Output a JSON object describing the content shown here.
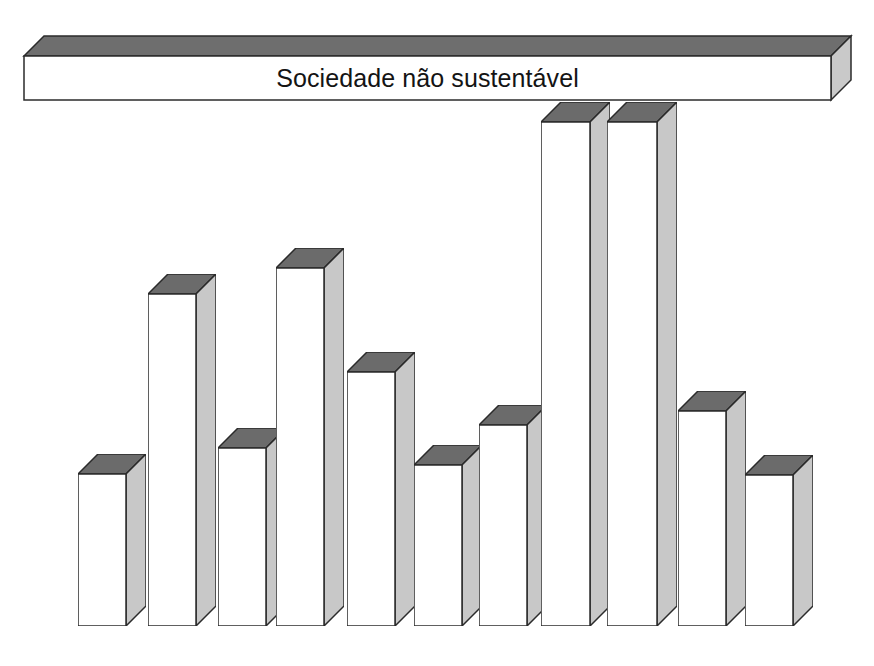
{
  "figure": {
    "title": "Sociedade não sustentável",
    "width": 874,
    "height": 666,
    "baseline_y": 626,
    "colors": {
      "top_face": "#6b6b6b",
      "front_face": "#ffffff",
      "side_face": "#c8c8c8",
      "outline": "#2b2b2b",
      "text": "#121212",
      "background": "#ffffff"
    },
    "depth_px": 20
  },
  "banner": {
    "label": "Sociedade não sustentável",
    "left": 24,
    "right": 831,
    "front_top": 56,
    "front_bottom": 100
  },
  "chart_data": {
    "type": "bar",
    "title": "Sociedade não sustentável",
    "subtitle": "",
    "xlabel": "",
    "ylabel": "",
    "orientation": "vertical",
    "style": "3d-isometric",
    "grid": false,
    "legend": false,
    "axis_visible": false,
    "value_labels": false,
    "ylim": [
      0,
      100
    ],
    "note": "Relative bar heights read off the drawing; the top banner spans the full width above all bars.",
    "categories": [
      "Estética",
      "Seguridade coletiva",
      "Oportunidade cultural",
      "Oportunidade econômica",
      "Oportunidade educacional",
      "Seguridade emocional",
      "Seguridade ambiental",
      "Liberdade individual e variedade",
      "Seguridade individual",
      "Oportunidade recreacional",
      "Espiritualismo"
    ],
    "category_lines": [
      [
        "Estética"
      ],
      [
        "Seguridade coletiva"
      ],
      [
        "Oportunidade",
        "cultural"
      ],
      [
        "Oportunidade econômica"
      ],
      [
        "Oportunidade",
        "educacional"
      ],
      [
        "Seguridade",
        "emocional"
      ],
      [
        "Seguridade",
        "ambiental"
      ],
      [
        "Liberdade individual e variedade"
      ],
      [
        "Seguridade individual"
      ],
      [
        "Oportunidade",
        "recreacional"
      ],
      [
        "Espiritualismo"
      ]
    ],
    "values": [
      31,
      66,
      35,
      71,
      50,
      32,
      40,
      100,
      100,
      43,
      30
    ],
    "top_y_px": [
      474,
      294,
      448,
      268,
      372,
      465,
      425,
      122,
      122,
      411,
      475
    ]
  },
  "bars": [
    {
      "name": "estetica",
      "left": 78,
      "width": 48,
      "top": 474,
      "lines": [
        "Estética"
      ]
    },
    {
      "name": "seguridade-coletiva",
      "left": 148,
      "width": 48,
      "top": 294,
      "lines": [
        "Seguridade coletiva"
      ]
    },
    {
      "name": "oportunidade-cultural",
      "left": 218,
      "width": 48,
      "top": 448,
      "lines": [
        "Oportunidade",
        "cultural"
      ]
    },
    {
      "name": "oportunidade-economica",
      "left": 276,
      "width": 48,
      "top": 268,
      "lines": [
        "Oportunidade econômica"
      ]
    },
    {
      "name": "oportunidade-educacional",
      "left": 347,
      "width": 48,
      "top": 372,
      "lines": [
        "Oportunidade",
        "educacional"
      ]
    },
    {
      "name": "seguridade-emocional",
      "left": 414,
      "width": 48,
      "top": 465,
      "lines": [
        "Seguridade",
        "emocional"
      ]
    },
    {
      "name": "seguridade-ambiental",
      "left": 479,
      "width": 48,
      "top": 425,
      "lines": [
        "Seguridade",
        "ambiental"
      ]
    },
    {
      "name": "liberdade-individual-e-variedade",
      "left": 541,
      "width": 49,
      "top": 122,
      "lines": [
        "Liberdade individual e variedade"
      ]
    },
    {
      "name": "seguridade-individual",
      "left": 607,
      "width": 50,
      "top": 122,
      "lines": [
        "Seguridade individual"
      ]
    },
    {
      "name": "oportunidade-recreacional",
      "left": 678,
      "width": 48,
      "top": 411,
      "lines": [
        "Oportunidade",
        "recreacional"
      ]
    },
    {
      "name": "espiritualismo",
      "left": 745,
      "width": 48,
      "top": 475,
      "lines": [
        "Espiritualismo"
      ]
    }
  ]
}
